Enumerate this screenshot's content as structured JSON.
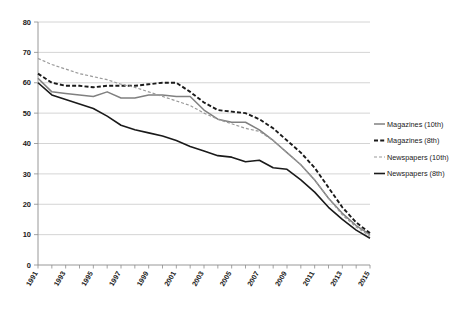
{
  "chart_data": {
    "type": "line",
    "title": "",
    "subtitle": "",
    "xlabel": "",
    "ylabel": "",
    "xlim": [
      1991,
      2015
    ],
    "ylim": [
      0,
      80
    ],
    "ytick_step": 10,
    "grid": "horizontal",
    "legend_position": "right",
    "yticks": [
      "0",
      "10",
      "20",
      "30",
      "40",
      "50",
      "60",
      "70",
      "80"
    ],
    "x": [
      1991,
      1992,
      1993,
      1994,
      1995,
      1996,
      1997,
      1998,
      1999,
      2000,
      2001,
      2002,
      2003,
      2004,
      2005,
      2006,
      2007,
      2008,
      2009,
      2010,
      2011,
      2012,
      2013,
      2014,
      2015
    ],
    "xtick_labels": [
      "1991",
      "1993",
      "1995",
      "1997",
      "1999",
      "2001",
      "2003",
      "2005",
      "2007",
      "2009",
      "2011",
      "2013",
      "2015"
    ],
    "series": [
      {
        "name": "Magazines (10th)",
        "style": "solid",
        "color": "#808080",
        "width": 1.5,
        "values": [
          61.5,
          57.0,
          56.5,
          56.0,
          55.5,
          57.0,
          55.0,
          55.0,
          56.0,
          56.0,
          55.5,
          55.5,
          51.0,
          48.0,
          47.0,
          47.0,
          44.5,
          41.0,
          37.0,
          33.0,
          28.0,
          22.0,
          17.0,
          13.0,
          10.0
        ]
      },
      {
        "name": "Magazines (8th)",
        "style": "dashed",
        "color": "#1a1a1a",
        "width": 1.9,
        "values": [
          63.0,
          60.0,
          59.0,
          59.0,
          58.5,
          59.0,
          59.0,
          59.0,
          59.5,
          60.0,
          60.0,
          57.0,
          53.5,
          51.0,
          50.5,
          50.0,
          48.0,
          45.0,
          41.0,
          37.0,
          32.0,
          25.5,
          19.0,
          14.0,
          10.5
        ]
      },
      {
        "name": "Newspapers (10th)",
        "style": "dotted-dash",
        "color": "#9a9a9a",
        "width": 1.2,
        "values": [
          68.0,
          66.0,
          64.5,
          63.0,
          62.0,
          61.0,
          59.5,
          58.5,
          57.0,
          55.5,
          54.0,
          52.5,
          50.0,
          48.0,
          46.5,
          45.0,
          44.0,
          41.0,
          37.0,
          33.0,
          28.0,
          22.0,
          16.5,
          12.5,
          9.5
        ]
      },
      {
        "name": "Newspapers (8th)",
        "style": "solid",
        "color": "#1a1a1a",
        "width": 1.6,
        "values": [
          60.0,
          56.0,
          54.5,
          53.0,
          51.5,
          49.0,
          46.0,
          44.5,
          43.5,
          42.5,
          41.0,
          39.0,
          37.5,
          36.0,
          35.5,
          34.0,
          34.5,
          32.0,
          31.5,
          28.0,
          24.0,
          19.0,
          15.0,
          11.5,
          8.8
        ]
      }
    ]
  },
  "legend": {
    "items": [
      {
        "label": "Magazines (10th)"
      },
      {
        "label": "Magazines (8th)"
      },
      {
        "label": "Newspapers (10th)"
      },
      {
        "label": "Newspapers (8th)"
      }
    ]
  }
}
